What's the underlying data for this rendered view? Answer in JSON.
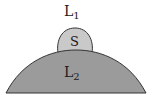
{
  "diagram": {
    "labels": {
      "outer_region": "L",
      "outer_region_sub": "1",
      "small_cap": "S",
      "large_dome": "L",
      "large_dome_sub": "2"
    },
    "colors": {
      "background": "#ffffff",
      "small_cap_fill": "#c9c9c9",
      "large_dome_fill": "#9b9b9b",
      "outline": "#333333"
    }
  }
}
